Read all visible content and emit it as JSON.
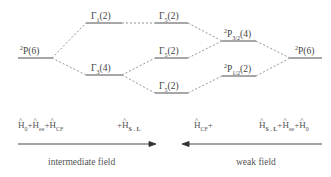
{
  "diagram": {
    "type": "energy-level-splitting",
    "levels": {
      "left_term": {
        "label": "P",
        "sup": "2",
        "deg": "(6)"
      },
      "cf_upper": {
        "label": "Γ",
        "sub": "1",
        "deg": "(2)"
      },
      "cf_lower": {
        "label": "Γ",
        "sub": "3",
        "deg": "(4)"
      },
      "mid_top": {
        "label": "Γ",
        "sub": "5",
        "deg": "(2)"
      },
      "mid_middle": {
        "label": "Γ",
        "sub": "5",
        "deg": "(2)"
      },
      "mid_bottom": {
        "label": "Γ",
        "sub": "5",
        "deg": "(2)"
      },
      "so_upper": {
        "label": "P",
        "sup": "2",
        "sub": "3/2",
        "deg": "(4)"
      },
      "so_lower": {
        "label": "P",
        "sup": "2",
        "sub": "1/2",
        "deg": "(2)"
      },
      "right_term": {
        "label": "P",
        "sup": "2",
        "deg": "(6)"
      }
    },
    "hamiltonians": {
      "left": {
        "h0": "H",
        "h0_sub": "0",
        "plus1": "+",
        "hee": "H",
        "hee_sub": "ee",
        "plus2": "+",
        "hcf": "H",
        "hcf_sub": "CF"
      },
      "left_so": {
        "plus": "+",
        "h": "H",
        "sub": "S . L"
      },
      "right_cf": {
        "h": "H",
        "sub": "CF",
        "plus": "+"
      },
      "right": {
        "hso": "H",
        "hso_sub": "S . L",
        "plus1": "+",
        "hee": "H",
        "hee_sub": "ee",
        "plus2": "+",
        "h0": "H",
        "h0_sub": "0"
      }
    },
    "arrows": {
      "left": {
        "direction": "right",
        "caption": "intermediate field"
      },
      "right": {
        "direction": "left",
        "caption": "weak field"
      }
    },
    "colors": {
      "line": "#333333",
      "dash": "#666666",
      "text": "#444444"
    }
  }
}
